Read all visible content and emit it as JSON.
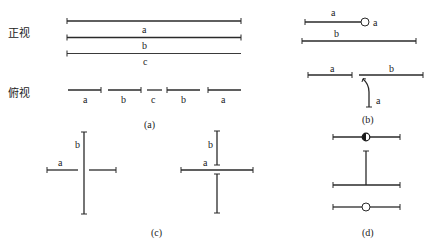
{
  "figure": {
    "panel_a": {
      "caption": "(a)",
      "front_view_label": "正视",
      "top_view_label": "俯视",
      "front_lines": [
        "a",
        "b",
        "c"
      ],
      "top_segments": [
        "a",
        "b",
        "c",
        "b",
        "a"
      ]
    },
    "panel_b": {
      "caption": "(b)",
      "top_line_label": "a",
      "circle_label": "a",
      "long_line_label": "b",
      "lower_left_label": "a",
      "lower_right_label": "b",
      "curve_label": "a"
    },
    "panel_c": {
      "caption": "(c)",
      "left": {
        "vertical_label": "b",
        "horizontal_label": "a"
      },
      "right": {
        "vertical_label": "b",
        "horizontal_label": "a"
      }
    },
    "panel_d": {
      "caption": "(d)"
    }
  }
}
